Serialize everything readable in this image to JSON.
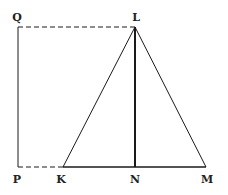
{
  "diagram": {
    "type": "geometry",
    "colors": {
      "line": "#1a1a1a",
      "background": "#ffffff"
    },
    "points": {
      "Q": {
        "label": "Q",
        "x": 18,
        "y": 27
      },
      "L": {
        "label": "L",
        "x": 135,
        "y": 27
      },
      "P": {
        "label": "P",
        "x": 18,
        "y": 167
      },
      "K": {
        "label": "K",
        "x": 63,
        "y": 167
      },
      "N": {
        "label": "N",
        "x": 135,
        "y": 167
      },
      "M": {
        "label": "M",
        "x": 206,
        "y": 167
      }
    },
    "segments": [
      {
        "from": "Q",
        "to": "L",
        "style": "dashed"
      },
      {
        "from": "Q",
        "to": "P",
        "style": "solid"
      },
      {
        "from": "P",
        "to": "K",
        "style": "dashed"
      },
      {
        "from": "K",
        "to": "M",
        "style": "solid"
      },
      {
        "from": "K",
        "to": "L",
        "style": "solid"
      },
      {
        "from": "L",
        "to": "M",
        "style": "solid"
      },
      {
        "from": "L",
        "to": "N",
        "style": "solid-thick"
      }
    ]
  }
}
